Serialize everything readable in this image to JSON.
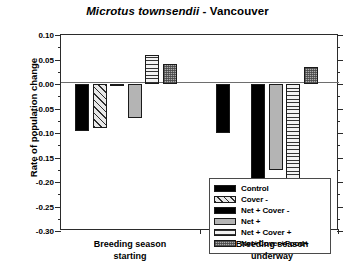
{
  "chart_data": {
    "type": "bar",
    "title": "Microtus townsendii - Vancouver",
    "title_species": "Microtus townsendii",
    "title_suffix": " - Vancouver",
    "xlabel": "",
    "ylabel": "Rate of population change",
    "ylim": [
      -0.3,
      0.1
    ],
    "ytick_step": 0.05,
    "ytick_labels": [
      "0.10",
      "0.05",
      "0.00",
      "-0.05",
      "-0.10",
      "-0.15",
      "-0.20",
      "-0.25",
      "-0.30"
    ],
    "ytick_values": [
      0.1,
      0.05,
      0.0,
      -0.05,
      -0.1,
      -0.15,
      -0.2,
      -0.25,
      -0.3
    ],
    "grid": false,
    "legend_position": "inside-center",
    "categories": [
      "Breeding season starting",
      "Breeding season underway"
    ],
    "series": [
      {
        "name": "Control",
        "pattern": "solid",
        "values": [
          -0.095,
          -0.1
        ]
      },
      {
        "name": "Cover -",
        "pattern": "diag",
        "values": [
          -0.09,
          null
        ]
      },
      {
        "name": "Net + Cover -",
        "pattern": "solid",
        "values": [
          -0.005,
          -0.243
        ]
      },
      {
        "name": "Net +",
        "pattern": "light",
        "values": [
          -0.07,
          -0.175
        ]
      },
      {
        "name": "Net + Cover +",
        "pattern": "grid",
        "values": [
          0.06,
          -0.21
        ]
      },
      {
        "name": "Net+Cover+Food+",
        "pattern": "stipple",
        "values": [
          0.04,
          0.035
        ]
      }
    ]
  },
  "legend": {
    "items": [
      {
        "label": "Control"
      },
      {
        "label": "Cover -"
      },
      {
        "label": "Net + Cover -"
      },
      {
        "label": "Net +"
      },
      {
        "label": "Net + Cover +"
      },
      {
        "label": "Net+Cover+Food+"
      }
    ]
  },
  "colors": {
    "axis": "#2b2b2b",
    "zero_line": "#6e6e6e",
    "solid": "#000000",
    "light_gray": "#b4b4b4",
    "stipple_gray": "#adadad",
    "background": "#ffffff"
  }
}
